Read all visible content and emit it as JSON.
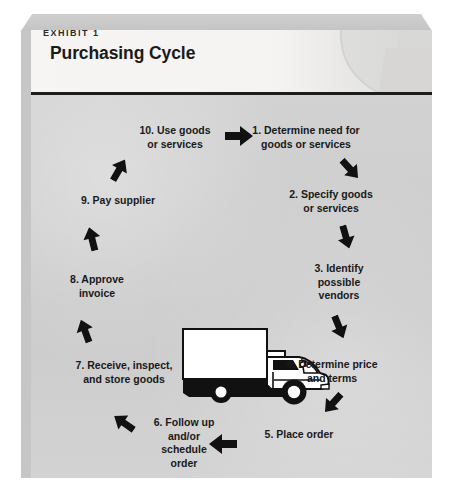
{
  "exhibit": {
    "kicker": "EXHIBIT 1",
    "title": "Purchasing Cycle"
  },
  "diagram": {
    "type": "cycle",
    "center_illustration": "delivery-box-truck",
    "direction": "clockwise",
    "steps": [
      {
        "n": 1,
        "label": "1. Determine need for\ngoods or services"
      },
      {
        "n": 2,
        "label": "2. Specify goods\nor services"
      },
      {
        "n": 3,
        "label": "3. Identify\npossible\nvendors"
      },
      {
        "n": 4,
        "label": "4. Determine price\nand terms"
      },
      {
        "n": 5,
        "label": "5. Place order"
      },
      {
        "n": 6,
        "label": "6. Follow up\nand/or\nschedule\norder"
      },
      {
        "n": 7,
        "label": "7. Receive, inspect,\nand store goods"
      },
      {
        "n": 8,
        "label": "8. Approve\ninvoice"
      },
      {
        "n": 9,
        "label": "9. Pay supplier"
      },
      {
        "n": 10,
        "label": "10. Use goods\nor services"
      }
    ],
    "arrows": [
      {
        "id": 1,
        "direction": "right"
      },
      {
        "id": 2,
        "direction": "down-right"
      },
      {
        "id": 3,
        "direction": "down"
      },
      {
        "id": 4,
        "direction": "down"
      },
      {
        "id": 5,
        "direction": "down-left"
      },
      {
        "id": 6,
        "direction": "left"
      },
      {
        "id": 7,
        "direction": "up-left"
      },
      {
        "id": 8,
        "direction": "up"
      },
      {
        "id": 9,
        "direction": "up"
      },
      {
        "id": 10,
        "direction": "up-right"
      }
    ]
  },
  "colors": {
    "panel_background": "#cdcdcd",
    "title_band": "#f4f3f1",
    "rule": "#1c1c1c",
    "text": "#191919",
    "arrow": "#111111",
    "page_background": "#ffffff"
  }
}
